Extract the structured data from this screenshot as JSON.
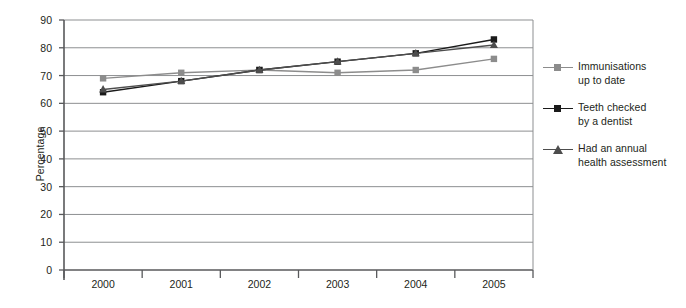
{
  "chart_data": {
    "type": "line",
    "title": "",
    "subtitle": "",
    "xlabel": "",
    "ylabel": "Percentage",
    "categories": [
      "2000",
      "2001",
      "2002",
      "2003",
      "2004",
      "2005"
    ],
    "ylim": [
      0,
      90
    ],
    "y_ticks": [
      0,
      10,
      20,
      30,
      40,
      50,
      60,
      70,
      80,
      90
    ],
    "y_tick_labels": [
      "0",
      "10",
      "20",
      "30",
      "40",
      "50",
      "60",
      "70",
      "80",
      "90"
    ],
    "grid": true,
    "grid_axis": "y",
    "legend_position": "right",
    "series": [
      {
        "name": "Immunisations up to date",
        "marker": "square",
        "color": "#8c8c8c",
        "values": [
          69,
          71,
          72,
          71,
          72,
          76
        ]
      },
      {
        "name": "Teeth checked by a dentist",
        "marker": "square",
        "color": "#1a1a1a",
        "values": [
          64,
          68,
          72,
          75,
          78,
          83
        ]
      },
      {
        "name": "Had an annual health assessment",
        "marker": "triangle",
        "color": "#4d4d4d",
        "values": [
          65,
          68,
          72,
          75,
          78,
          81
        ]
      }
    ],
    "legend_entries": [
      {
        "line1": "Immunisations",
        "line2": "up to date"
      },
      {
        "line1": "Teeth checked",
        "line2": "by a dentist"
      },
      {
        "line1": "Had an annual",
        "line2": "health assessment"
      }
    ],
    "axis_color": "#58595b",
    "grid_color": "#8d8f91",
    "background": "#ffffff"
  }
}
